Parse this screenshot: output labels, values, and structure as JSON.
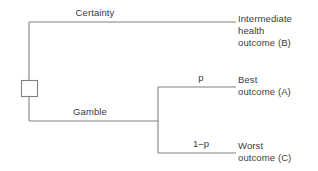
{
  "diagram": {
    "type": "decision-tree",
    "line_color": "#808080",
    "text_color": "#3b3b3b",
    "background_color": "#ffffff",
    "decision_node": {
      "shape": "square",
      "name": "decision-node"
    },
    "branches": {
      "certainty": {
        "label": "Certainty",
        "outcome": {
          "line1": "Intermediate",
          "line2": "health",
          "line3": "outcome (B)"
        }
      },
      "gamble": {
        "label": "Gamble",
        "upper": {
          "probability": "p",
          "outcome": {
            "line1": "Best",
            "line2": "outcome (A)"
          }
        },
        "lower": {
          "probability": "1–p",
          "outcome": {
            "line1": "Worst",
            "line2": "outcome (C)"
          }
        }
      }
    }
  }
}
